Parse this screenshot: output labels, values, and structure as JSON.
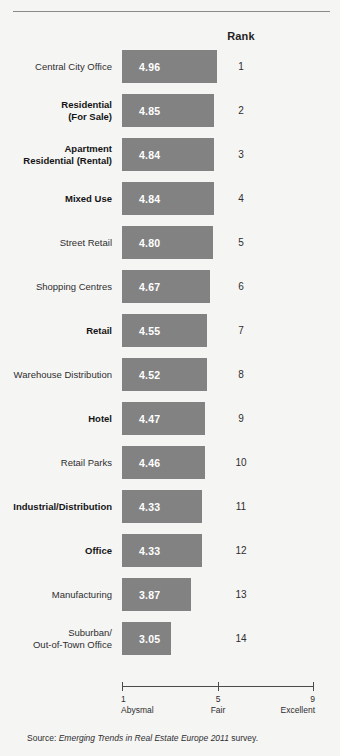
{
  "header": {
    "rank_label": "Rank"
  },
  "axis": {
    "ticks": [
      {
        "num": "1",
        "word": "Abysmal",
        "value": 1
      },
      {
        "num": "5",
        "word": "Fair",
        "value": 5
      },
      {
        "num": "9",
        "word": "Excellent",
        "value": 9
      }
    ]
  },
  "source": {
    "prefix": "Source:",
    "title": "Emerging Trends in Real Estate Europe 2011",
    "suffix": "survey."
  },
  "chart_data": {
    "type": "bar",
    "orientation": "horizontal",
    "title": "",
    "xlabel": "",
    "ylabel": "",
    "xlim": [
      1,
      9
    ],
    "grid": false,
    "legend": null,
    "value_axis_ticks": [
      1,
      5,
      9
    ],
    "value_axis_tick_labels": [
      "1 Abysmal",
      "5 Fair",
      "9 Excellent"
    ],
    "categories": [
      "Central City Office",
      "Residential\n(For Sale)",
      "Apartment\nResidential (Rental)",
      "Mixed Use",
      "Street Retail",
      "Shopping Centres",
      "Retail",
      "Warehouse Distribution",
      "Hotel",
      "Retail Parks",
      "Industrial/Distribution",
      "Office",
      "Manufacturing",
      "Suburban/\nOut-of-Town Office"
    ],
    "values": [
      4.96,
      4.85,
      4.84,
      4.84,
      4.8,
      4.67,
      4.55,
      4.52,
      4.47,
      4.46,
      4.33,
      4.33,
      3.87,
      3.05
    ],
    "value_labels": [
      "4.96",
      "4.85",
      "4.84",
      "4.84",
      "4.80",
      "4.67",
      "4.55",
      "4.52",
      "4.47",
      "4.46",
      "4.33",
      "4.33",
      "3.87",
      "3.05"
    ],
    "ranks": [
      "1",
      "2",
      "3",
      "4",
      "5",
      "6",
      "7",
      "8",
      "9",
      "10",
      "11",
      "12",
      "13",
      "14"
    ],
    "emphasis": [
      false,
      true,
      true,
      true,
      false,
      false,
      true,
      false,
      true,
      false,
      true,
      true,
      false,
      false
    ],
    "bar_color": "#828282",
    "value_text_color": "#ffffff",
    "background_color": "#f5f5f4"
  }
}
